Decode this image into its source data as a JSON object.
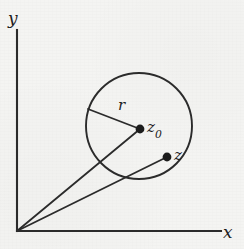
{
  "figure": {
    "kind": "complex-plane-disk-diagram",
    "background_color": "#f4f4f2",
    "ink_color": "#2b2b2b",
    "axes": {
      "y_label": "y",
      "x_label": "x",
      "origin": {
        "x": 17,
        "y": 231
      },
      "y_axis_top": {
        "x": 17,
        "y": 30
      },
      "x_axis_right": {
        "x": 221,
        "y": 231
      }
    },
    "circle": {
      "center": {
        "x": 139,
        "y": 126
      },
      "radius": 53,
      "radius_label": "r",
      "radius_endpoint": {
        "x": 88,
        "y": 109
      }
    },
    "points": [
      {
        "id": "z0",
        "label": "z",
        "subscript": "0",
        "x": 140,
        "y": 129,
        "dot_radius": 4.4
      },
      {
        "id": "z",
        "label": "z",
        "subscript": "",
        "x": 167,
        "y": 157,
        "dot_radius": 4.4
      }
    ],
    "vectors": [
      {
        "name": "origin-to-z0",
        "from": {
          "x": 17,
          "y": 231
        },
        "to": {
          "x": 140,
          "y": 129
        }
      },
      {
        "name": "origin-to-z",
        "from": {
          "x": 17,
          "y": 231
        },
        "to": {
          "x": 167,
          "y": 157
        }
      }
    ]
  }
}
